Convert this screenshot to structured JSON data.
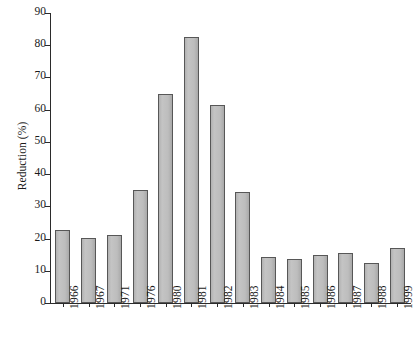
{
  "chart_data": {
    "type": "bar",
    "title": "",
    "xlabel": "",
    "ylabel": "Reduction (%)",
    "categories": [
      "1966",
      "1967",
      "1971",
      "1976",
      "1980",
      "1981",
      "1982",
      "1983",
      "1984",
      "1985",
      "1986",
      "1987",
      "1988",
      "1999"
    ],
    "values": [
      22.7,
      20.2,
      21.2,
      35.0,
      64.8,
      82.5,
      61.3,
      34.5,
      14.2,
      13.8,
      15.0,
      15.5,
      12.3,
      17.0
    ],
    "ylim": [
      0,
      90
    ],
    "yticks": [
      0,
      10,
      20,
      30,
      40,
      50,
      60,
      70,
      80,
      90
    ],
    "ytick_labels": [
      "0",
      "10",
      "20",
      "30",
      "40",
      "50",
      "60",
      "70",
      "80",
      "90"
    ],
    "grid": false,
    "legend": null,
    "bar_fill_color": "#bdbdbd",
    "bar_edge_color": "#575757",
    "axis_color": "#2b2b2b",
    "background_color": "#ffffff"
  }
}
